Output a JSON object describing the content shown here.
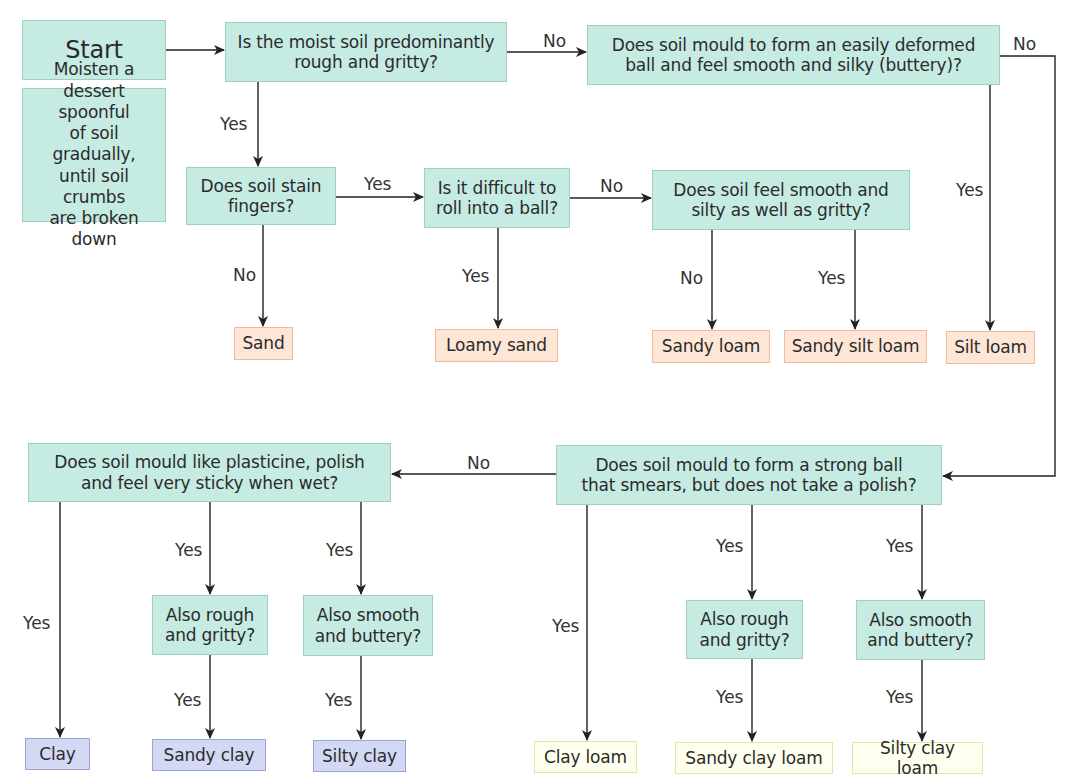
{
  "diagram": {
    "type": "flowchart",
    "colors": {
      "question_fill": "#c6ebe3",
      "question_border": "#9fcfc3",
      "result_orange_fill": "#fde6d6",
      "result_orange_border": "#f4b996",
      "result_blue_fill": "#d3d8f4",
      "result_blue_border": "#9aa3d6",
      "result_yellow_fill": "#fffff0",
      "result_yellow_border": "#e4e6a4",
      "line": "#222222"
    },
    "nodes": {
      "start": "Start",
      "note": "Moisten a\ndessert spoonful\nof soil gradually,\nuntil soil crumbs\nare broken down",
      "q_rough_gritty": "Is the moist soil predominantly\nrough and gritty?",
      "q_easily_deformed": "Does soil mould to form an easily deformed\nball and feel smooth and silky (buttery)?",
      "q_stain_fingers": "Does soil stain\nfingers?",
      "q_difficult_roll": "Is it difficult to\nroll into a ball?",
      "q_smooth_silty": "Does soil feel smooth and\nsilty as well as gritty?",
      "r_sand": "Sand",
      "r_loamy_sand": "Loamy sand",
      "r_sandy_loam": "Sandy loam",
      "r_sandy_silt_loam": "Sandy silt loam",
      "r_silt_loam": "Silt loam",
      "q_plasticine": "Does soil mould like plasticine, polish\nand feel very sticky when wet?",
      "q_strong_ball": "Does soil mould  to form a strong ball\nthat smears, but does not take a polish?",
      "q_also_rough_left": "Also rough\nand gritty?",
      "q_also_smooth_left": "Also smooth\nand buttery?",
      "q_also_rough_right": "Also rough\nand gritty?",
      "q_also_smooth_right": "Also smooth\nand buttery?",
      "r_clay": "Clay",
      "r_sandy_clay": "Sandy clay",
      "r_silty_clay": "Silty clay",
      "r_clay_loam": "Clay loam",
      "r_sandy_clay_loam": "Sandy clay loam",
      "r_silty_clay_loam": "Silty clay loam"
    },
    "edge_labels": {
      "q1_no": "No",
      "q1_yes": "Yes",
      "q2_no": "No",
      "q2_yes": "Yes",
      "q3_yes": "Yes",
      "q3_no": "No",
      "q4_no": "No",
      "q4_yes": "Yes",
      "q5_no": "No",
      "q5_yes": "Yes",
      "q7_no": "No",
      "q6_yes_clay": "Yes",
      "q6_yes_rough": "Yes",
      "q6_yes_smooth": "Yes",
      "rough_left_yes": "Yes",
      "smooth_left_yes": "Yes",
      "q7_yes_clay_loam": "Yes",
      "q7_yes_rough": "Yes",
      "q7_yes_smooth": "Yes",
      "rough_right_yes": "Yes",
      "smooth_right_yes": "Yes"
    },
    "edges": [
      {
        "from": "start",
        "to": "q_rough_gritty",
        "label": ""
      },
      {
        "from": "q_rough_gritty",
        "to": "q_easily_deformed",
        "label": "No"
      },
      {
        "from": "q_rough_gritty",
        "to": "q_stain_fingers",
        "label": "Yes"
      },
      {
        "from": "q_stain_fingers",
        "to": "q_difficult_roll",
        "label": "Yes"
      },
      {
        "from": "q_stain_fingers",
        "to": "r_sand",
        "label": "No"
      },
      {
        "from": "q_difficult_roll",
        "to": "q_smooth_silty",
        "label": "No"
      },
      {
        "from": "q_difficult_roll",
        "to": "r_loamy_sand",
        "label": "Yes"
      },
      {
        "from": "q_smooth_silty",
        "to": "r_sandy_loam",
        "label": "No"
      },
      {
        "from": "q_smooth_silty",
        "to": "r_sandy_silt_loam",
        "label": "Yes"
      },
      {
        "from": "q_easily_deformed",
        "to": "r_silt_loam",
        "label": "Yes"
      },
      {
        "from": "q_easily_deformed",
        "to": "q_strong_ball",
        "label": "No"
      },
      {
        "from": "q_strong_ball",
        "to": "q_plasticine",
        "label": "No"
      },
      {
        "from": "q_strong_ball",
        "to": "r_clay_loam",
        "label": "Yes"
      },
      {
        "from": "q_strong_ball",
        "to": "q_also_rough_right",
        "label": "Yes"
      },
      {
        "from": "q_strong_ball",
        "to": "q_also_smooth_right",
        "label": "Yes"
      },
      {
        "from": "q_also_rough_right",
        "to": "r_sandy_clay_loam",
        "label": "Yes"
      },
      {
        "from": "q_also_smooth_right",
        "to": "r_silty_clay_loam",
        "label": "Yes"
      },
      {
        "from": "q_plasticine",
        "to": "r_clay",
        "label": "Yes"
      },
      {
        "from": "q_plasticine",
        "to": "q_also_rough_left",
        "label": "Yes"
      },
      {
        "from": "q_plasticine",
        "to": "q_also_smooth_left",
        "label": "Yes"
      },
      {
        "from": "q_also_rough_left",
        "to": "r_sandy_clay",
        "label": "Yes"
      },
      {
        "from": "q_also_smooth_left",
        "to": "r_silty_clay",
        "label": "Yes"
      }
    ]
  }
}
